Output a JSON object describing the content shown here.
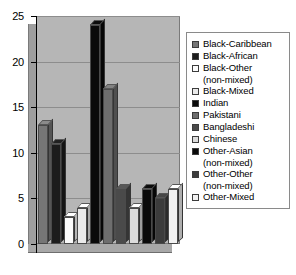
{
  "chart_data": {
    "type": "bar",
    "title": "",
    "xlabel": "",
    "ylabel": "",
    "ylim": [
      0,
      25
    ],
    "yticks": [
      0,
      5,
      10,
      15,
      20,
      25
    ],
    "grid": true,
    "legend_position": "right",
    "categories": [
      "Black-Caribbean",
      "Black-African",
      "Black-Other (non-mixed)",
      "Black-Mixed",
      "Indian",
      "Pakistani",
      "Bangladeshi",
      "Chinese",
      "Other-Asian (non-mixed)",
      "Other-Other (non-mixed)",
      "Other-Mixed"
    ],
    "values": [
      13,
      11,
      3,
      4,
      24,
      17,
      6,
      4,
      6,
      5,
      6
    ],
    "colors": [
      "#767676",
      "#1c1c1c",
      "#fbfbfb",
      "#eaeaea",
      "#0a0a0a",
      "#6e6e6e",
      "#4a4a4a",
      "#dcdcdc",
      "#0a0a0a",
      "#3c3c3c",
      "#f2f2f2"
    ]
  },
  "legend": {
    "items": [
      {
        "label": "Black-Caribbean",
        "sub": "",
        "color": "#767676"
      },
      {
        "label": "Black-African",
        "sub": "",
        "color": "#1c1c1c"
      },
      {
        "label": "Black-Other",
        "sub": "(non-mixed)",
        "color": "#fbfbfb"
      },
      {
        "label": "Black-Mixed",
        "sub": "",
        "color": "#eaeaea"
      },
      {
        "label": "Indian",
        "sub": "",
        "color": "#0a0a0a"
      },
      {
        "label": "Pakistani",
        "sub": "",
        "color": "#6e6e6e"
      },
      {
        "label": "Bangladeshi",
        "sub": "",
        "color": "#4a4a4a"
      },
      {
        "label": "Chinese",
        "sub": "",
        "color": "#dcdcdc"
      },
      {
        "label": "Other-Asian",
        "sub": "(non-mixed)",
        "color": "#0a0a0a"
      },
      {
        "label": "Other-Other",
        "sub": "(non-mixed)",
        "color": "#3c3c3c"
      },
      {
        "label": "Other-Mixed",
        "sub": "",
        "color": "#f2f2f2"
      }
    ]
  },
  "axis": {
    "tick_labels": [
      "25",
      "20",
      "15",
      "10",
      "5",
      "0"
    ]
  }
}
